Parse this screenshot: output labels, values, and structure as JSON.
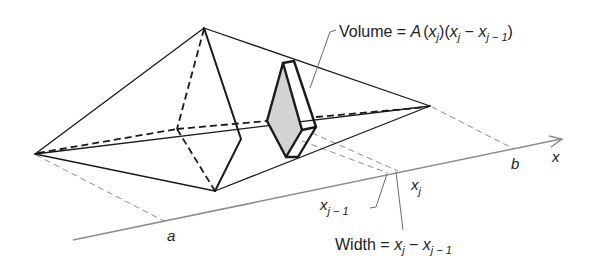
{
  "figure": {
    "colors": {
      "edges": "#1a1a1a",
      "axis": "#8c8c8c",
      "slab_fill": "#d3d3d3",
      "background": "#ffffff"
    }
  },
  "labels": {
    "volume_label": {
      "prefix": "Volume = ",
      "A": "A",
      "paren_open1": "(",
      "x1": "x",
      "sub1": "j",
      "paren_close1": ")",
      "paren_open2": "(",
      "x2": "x",
      "sub2": "j",
      "minus": " − ",
      "x3": "x",
      "sub3": "j − 1",
      "paren_close2": ")"
    },
    "width_label": {
      "prefix": "Width = ",
      "x1": "x",
      "sub1": "j",
      "minus": " − ",
      "x2": "x",
      "sub2": "j − 1"
    },
    "axis": {
      "a": "a",
      "b": "b",
      "x": "x",
      "xj": "x",
      "xj_sub": "j",
      "xj1": "x",
      "xj1_sub": "j − 1"
    }
  }
}
